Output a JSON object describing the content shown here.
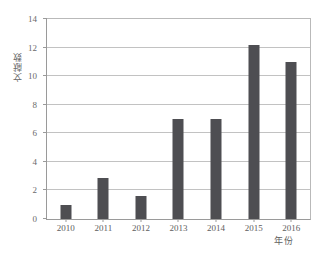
{
  "chart_data": {
    "type": "bar",
    "title": "",
    "xlabel": "年份",
    "ylabel": "文献数",
    "categories": [
      "2010",
      "2011",
      "2012",
      "2013",
      "2014",
      "2015",
      "2016"
    ],
    "values": [
      1,
      2.9,
      1.6,
      7,
      7,
      12.2,
      11
    ],
    "ylim": [
      0,
      14
    ],
    "yticks": [
      0,
      2,
      4,
      6,
      8,
      10,
      12,
      14
    ],
    "ytick_labels": [
      "0",
      "2",
      "4",
      "6",
      "8",
      "10",
      "12",
      "14"
    ],
    "grid": true,
    "legend": false,
    "bar_color": "#4e4e52",
    "grid_color": "#c2c2c2",
    "axis_color": "#9a9a9a",
    "background": "#ffffff"
  }
}
